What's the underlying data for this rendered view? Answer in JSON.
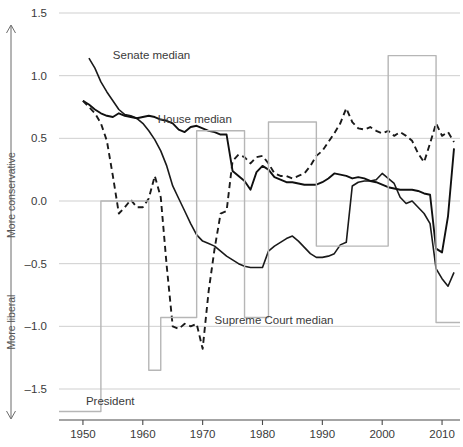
{
  "figure": {
    "title": "",
    "y_axis_direction_top": "More conservative",
    "y_axis_direction_bottom": "More liberal",
    "annotations": {
      "senate": "Senate median",
      "house": "House median",
      "court": "Supreme Court median",
      "president": "President"
    }
  },
  "chart_data": {
    "type": "line",
    "title": "",
    "xlabel": "",
    "ylabel": "",
    "xlim": [
      1946,
      2013
    ],
    "ylim": [
      -1.75,
      1.6
    ],
    "xticks": [
      1950,
      1960,
      1970,
      1980,
      1990,
      2000,
      2010
    ],
    "xtick_labels": [
      "1950",
      "1960",
      "1970",
      "1980",
      "1990",
      "2000",
      "2010"
    ],
    "yticks": [
      1.5,
      1.0,
      0.5,
      0.0,
      -0.5,
      -1.0,
      -1.5
    ],
    "ytick_labels": [
      "1.5",
      "1.0",
      "0.5",
      "0.0",
      "-0.5",
      "-1.0",
      "-1.5"
    ],
    "grid": "horizontal",
    "legend_position": "inline-annotations",
    "y_direction_note": {
      "up": "More conservative",
      "down": "More liberal"
    },
    "series": [
      {
        "name": "Senate median",
        "style": "solid",
        "color": "#1a1a1a",
        "width": 1.6,
        "label_x": 1955.0,
        "label_y": 1.13,
        "x": [
          1951,
          1952,
          1953,
          1954,
          1955,
          1956,
          1957,
          1958,
          1959,
          1960,
          1961,
          1962,
          1963,
          1964,
          1965,
          1966,
          1967,
          1968,
          1969,
          1970,
          1971,
          1972,
          1973,
          1974,
          1975,
          1976,
          1977,
          1978,
          1979,
          1980,
          1981,
          1982,
          1983,
          1984,
          1985,
          1986,
          1987,
          1988,
          1989,
          1990,
          1991,
          1992,
          1993,
          1994,
          1995,
          1996,
          1997,
          1998,
          1999,
          2000,
          2001,
          2002,
          2003,
          2004,
          2005,
          2006,
          2007,
          2008,
          2009,
          2010,
          2011,
          2012
        ],
        "y": [
          1.14,
          1.06,
          0.95,
          0.87,
          0.8,
          0.73,
          0.69,
          0.68,
          0.66,
          0.62,
          0.56,
          0.49,
          0.4,
          0.28,
          0.12,
          0.02,
          -0.08,
          -0.18,
          -0.27,
          -0.32,
          -0.34,
          -0.36,
          -0.4,
          -0.44,
          -0.47,
          -0.5,
          -0.52,
          -0.53,
          -0.53,
          -0.53,
          -0.4,
          -0.36,
          -0.33,
          -0.3,
          -0.28,
          -0.32,
          -0.37,
          -0.42,
          -0.45,
          -0.45,
          -0.44,
          -0.42,
          -0.35,
          -0.33,
          0.12,
          0.15,
          0.16,
          0.16,
          0.17,
          0.22,
          0.18,
          0.14,
          0.03,
          -0.02,
          0.0,
          -0.05,
          -0.1,
          -0.18,
          -0.54,
          -0.62,
          -0.68,
          -0.57
        ]
      },
      {
        "name": "House median",
        "style": "solid",
        "color": "#101010",
        "width": 1.9,
        "label_x": 1962.5,
        "label_y": 0.62,
        "x": [
          1950,
          1951,
          1952,
          1953,
          1954,
          1955,
          1956,
          1957,
          1958,
          1959,
          1960,
          1961,
          1962,
          1963,
          1964,
          1965,
          1966,
          1967,
          1968,
          1969,
          1970,
          1971,
          1972,
          1973,
          1974,
          1975,
          1976,
          1977,
          1978,
          1979,
          1980,
          1981,
          1982,
          1983,
          1984,
          1985,
          1986,
          1987,
          1988,
          1989,
          1990,
          1991,
          1992,
          1993,
          1994,
          1995,
          1996,
          1997,
          1998,
          1999,
          2000,
          2001,
          2002,
          2003,
          2004,
          2005,
          2006,
          2007,
          2008,
          2009,
          2010,
          2011,
          2012
        ],
        "y": [
          0.8,
          0.77,
          0.73,
          0.7,
          0.68,
          0.67,
          0.7,
          0.68,
          0.67,
          0.66,
          0.67,
          0.68,
          0.67,
          0.65,
          0.64,
          0.62,
          0.57,
          0.55,
          0.59,
          0.6,
          0.58,
          0.56,
          0.55,
          0.53,
          0.53,
          0.24,
          0.2,
          0.16,
          0.09,
          0.23,
          0.28,
          0.25,
          0.19,
          0.17,
          0.15,
          0.15,
          0.14,
          0.13,
          0.13,
          0.13,
          0.15,
          0.18,
          0.22,
          0.21,
          0.2,
          0.18,
          0.19,
          0.18,
          0.16,
          0.15,
          0.13,
          0.11,
          0.1,
          0.09,
          0.09,
          0.09,
          0.08,
          0.06,
          0.05,
          -0.38,
          -0.41,
          -0.12,
          0.42
        ]
      },
      {
        "name": "Supreme Court median",
        "style": "dashed",
        "color": "#1a1a1a",
        "width": 1.9,
        "label_x": 1972.0,
        "label_y": -0.98,
        "x": [
          1950,
          1951,
          1952,
          1953,
          1954,
          1955,
          1956,
          1957,
          1958,
          1959,
          1960,
          1961,
          1962,
          1963,
          1964,
          1965,
          1966,
          1967,
          1968,
          1969,
          1970,
          1971,
          1972,
          1973,
          1974,
          1975,
          1976,
          1977,
          1978,
          1979,
          1980,
          1981,
          1982,
          1983,
          1984,
          1985,
          1986,
          1987,
          1988,
          1989,
          1990,
          1991,
          1992,
          1993,
          1994,
          1995,
          1996,
          1997,
          1998,
          1999,
          2000,
          2001,
          2002,
          2003,
          2004,
          2005,
          2006,
          2007,
          2008,
          2009,
          2010,
          2011,
          2012
        ],
        "y": [
          0.8,
          0.75,
          0.7,
          0.62,
          0.48,
          0.2,
          -0.1,
          -0.05,
          0.01,
          -0.05,
          -0.05,
          0.02,
          0.2,
          0.03,
          -0.52,
          -1.0,
          -1.02,
          -0.98,
          -1.0,
          -0.98,
          -1.18,
          -0.72,
          -0.38,
          -0.1,
          -0.08,
          0.32,
          0.37,
          0.35,
          0.3,
          0.35,
          0.36,
          0.3,
          0.22,
          0.2,
          0.2,
          0.18,
          0.2,
          0.22,
          0.28,
          0.36,
          0.4,
          0.47,
          0.54,
          0.62,
          0.74,
          0.63,
          0.58,
          0.57,
          0.59,
          0.56,
          0.54,
          0.56,
          0.52,
          0.55,
          0.52,
          0.48,
          0.38,
          0.31,
          0.46,
          0.62,
          0.52,
          0.55,
          0.47
        ]
      },
      {
        "name": "President",
        "style": "step",
        "color": "#b6b6b6",
        "width": 1.4,
        "label_x": 1950.5,
        "label_y": -1.63,
        "x": [
          1946,
          1953,
          1953,
          1961,
          1961,
          1963,
          1963,
          1969,
          1969,
          1977,
          1977,
          1981,
          1981,
          1989,
          1989,
          1993,
          1993,
          2001,
          2001,
          2009,
          2009,
          2013
        ],
        "y": [
          -1.68,
          -1.68,
          0.0,
          0.0,
          -1.35,
          -1.35,
          -0.93,
          -0.93,
          0.56,
          0.56,
          -0.93,
          -0.93,
          0.63,
          0.63,
          -0.36,
          -0.36,
          -0.36,
          -0.36,
          1.16,
          1.16,
          -0.97,
          -0.97
        ]
      }
    ]
  }
}
